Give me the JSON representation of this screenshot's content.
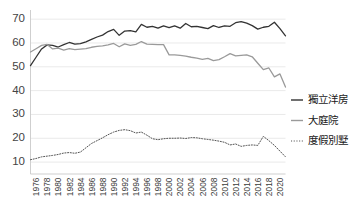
{
  "chart_data": {
    "type": "line",
    "title": "",
    "subtitle": "",
    "xlabel": "",
    "ylabel": "",
    "xlim": [
      1975,
      2021
    ],
    "ylim": [
      5,
      73
    ],
    "grid": true,
    "legend_position": "right",
    "y_ticks": [
      10,
      20,
      30,
      40,
      50,
      60,
      70
    ],
    "x_ticks": [
      1976,
      1978,
      1980,
      1982,
      1984,
      1986,
      1988,
      1990,
      1992,
      1994,
      1996,
      1998,
      2000,
      2002,
      2004,
      2006,
      2008,
      2010,
      2012,
      2014,
      2016,
      2018,
      2020
    ],
    "x": [
      1975,
      1976,
      1977,
      1978,
      1979,
      1980,
      1981,
      1982,
      1983,
      1984,
      1985,
      1986,
      1987,
      1988,
      1989,
      1990,
      1991,
      1992,
      1993,
      1994,
      1995,
      1996,
      1997,
      1998,
      1999,
      2000,
      2001,
      2002,
      2003,
      2004,
      2005,
      2006,
      2007,
      2008,
      2009,
      2010,
      2011,
      2012,
      2013,
      2014,
      2015,
      2016,
      2017,
      2018,
      2019,
      2020,
      2021
    ],
    "series": [
      {
        "name": "獨立洋房",
        "style": "solid",
        "color": "#333333",
        "values": [
          50.5,
          54.0,
          57.5,
          59.2,
          59.0,
          58.3,
          59.3,
          60.2,
          59.5,
          59.7,
          60.5,
          61.5,
          62.5,
          63.3,
          64.8,
          65.7,
          63.2,
          65.0,
          65.2,
          64.7,
          67.8,
          66.6,
          67.0,
          66.2,
          67.2,
          66.4,
          67.2,
          66.2,
          68.2,
          66.8,
          67.0,
          66.5,
          66.0,
          67.3,
          66.5,
          67.2,
          67.0,
          68.5,
          69.0,
          68.3,
          67.3,
          65.8,
          66.6,
          67.0,
          68.7,
          66.0,
          63.0
        ]
      },
      {
        "name": "大庭院",
        "style": "solid",
        "color": "#9a9a9a",
        "values": [
          56.2,
          57.6,
          59.0,
          59.4,
          57.5,
          57.8,
          57.0,
          57.6,
          57.2,
          57.4,
          57.6,
          58.2,
          58.6,
          58.8,
          59.2,
          59.8,
          58.4,
          59.6,
          59.0,
          59.4,
          60.6,
          59.5,
          59.4,
          59.3,
          59.3,
          55.0,
          55.0,
          54.8,
          54.5,
          54.0,
          53.6,
          53.1,
          53.5,
          52.6,
          53.0,
          54.2,
          55.5,
          54.6,
          54.8,
          55.0,
          54.2,
          51.5,
          48.8,
          49.5,
          45.8,
          47.0,
          41.5
        ]
      },
      {
        "name": "度假別墅",
        "style": "dotted",
        "color": "#555555",
        "values": [
          11.0,
          11.5,
          12.2,
          12.5,
          12.8,
          13.2,
          13.8,
          14.0,
          13.7,
          14.2,
          16.0,
          17.8,
          19.0,
          20.2,
          21.5,
          22.6,
          23.3,
          23.6,
          23.2,
          22.2,
          22.6,
          21.3,
          19.8,
          19.4,
          19.8,
          20.0,
          20.0,
          20.1,
          19.9,
          20.3,
          20.2,
          19.8,
          19.5,
          19.2,
          18.8,
          18.3,
          17.2,
          17.6,
          16.6,
          17.0,
          17.2,
          17.0,
          20.8,
          19.0,
          17.0,
          14.6,
          12.2
        ]
      }
    ]
  },
  "legend": {
    "items": [
      {
        "label": "獨立洋房"
      },
      {
        "label": "大庭院"
      },
      {
        "label": "度假別墅"
      }
    ]
  }
}
